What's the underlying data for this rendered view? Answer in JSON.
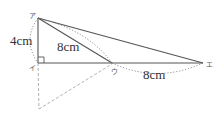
{
  "figure": {
    "type": "geometry-diagram",
    "vertices": [
      {
        "id": "top",
        "label": "ア",
        "x": 38,
        "y": 18
      },
      {
        "id": "bottom-left",
        "label": "イ",
        "x": 38,
        "y": 63
      },
      {
        "id": "middle",
        "label": "ウ",
        "x": 112,
        "y": 63
      },
      {
        "id": "right",
        "label": "エ",
        "x": 203,
        "y": 63
      }
    ],
    "measurements": [
      {
        "between": "top-bottom-left",
        "label": "4cm"
      },
      {
        "between": "top-middle",
        "label": "8cm"
      },
      {
        "between": "middle-right",
        "label": "8cm"
      }
    ],
    "right_angle_at": "bottom-left",
    "colors": {
      "line": "#555555",
      "dashed": "#aaaaaa",
      "dotted": "#777777",
      "text": "#333333"
    }
  }
}
